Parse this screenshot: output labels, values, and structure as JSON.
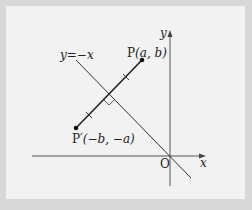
{
  "figure": {
    "line_label": "y=−x",
    "point_p": {
      "name": "P",
      "coords_label": "(a, b)"
    },
    "point_p_prime": {
      "name": "P′",
      "coords_label": "(−b, −a)"
    },
    "origin_label": "O",
    "x_axis_label": "x",
    "y_axis_label": "y",
    "colors": {
      "background": "#f2f2f2",
      "border": "#d8d8d8",
      "stroke": "#222222"
    }
  }
}
